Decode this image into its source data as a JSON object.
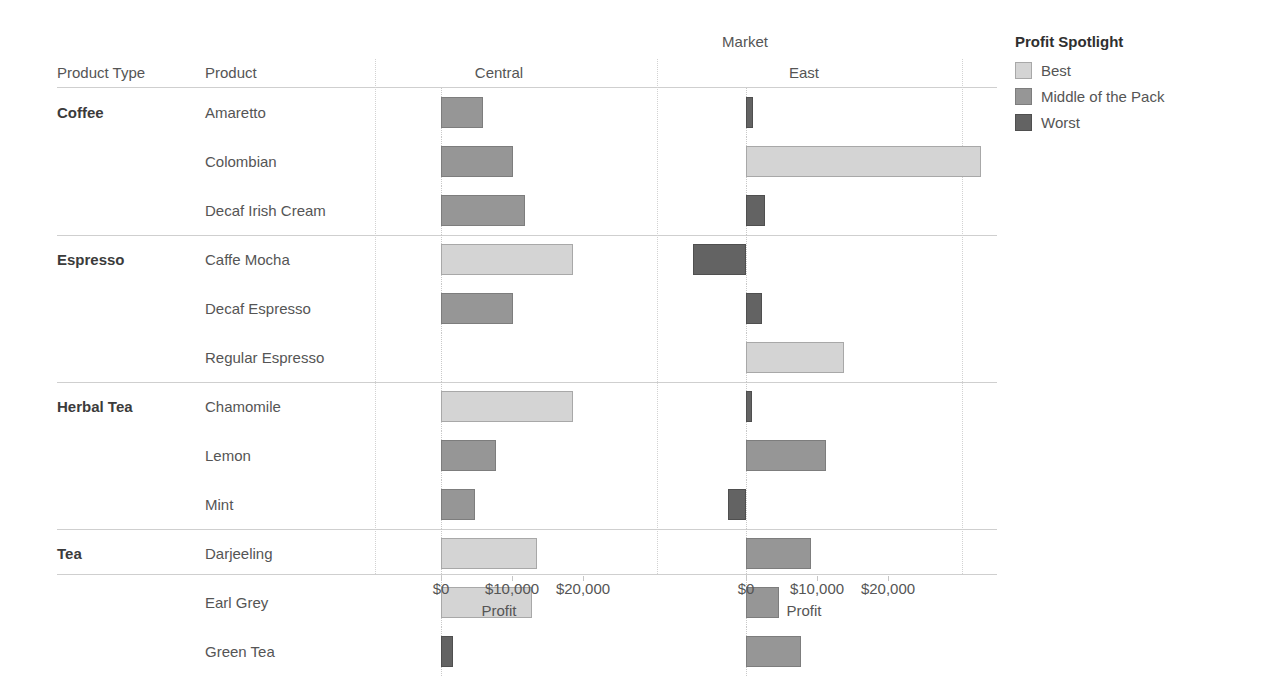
{
  "headers": {
    "product_type": "Product Type",
    "product": "Product",
    "market_band": "Market"
  },
  "legend": {
    "title": "Profit Spotlight",
    "items": [
      {
        "label": "Best",
        "key": "best",
        "color": "#d4d4d4"
      },
      {
        "label": "Middle of the Pack",
        "key": "mid",
        "color": "#969696"
      },
      {
        "label": "Worst",
        "key": "worst",
        "color": "#636363"
      }
    ]
  },
  "axis": {
    "title": "Profit",
    "ticks": [
      "$0",
      "$10,000",
      "$20,000"
    ],
    "tick_values": [
      0,
      10000,
      20000
    ]
  },
  "chart_data": {
    "type": "bar",
    "title": "Market",
    "xlabel": "Profit",
    "ylabel": "Product",
    "orientation": "horizontal",
    "grid": true,
    "legend_position": "right",
    "legend_title": "Profit Spotlight",
    "xlim": [
      -10000,
      35000
    ],
    "xticks": [
      0,
      10000,
      20000
    ],
    "xticklabels": [
      "$0",
      "$10,000",
      "$20,000"
    ],
    "panels": [
      "Central",
      "East"
    ],
    "groups": [
      {
        "product_type": "Coffee",
        "products": [
          {
            "name": "Amaretto",
            "Central": 5900,
            "Central_spotlight": "mid",
            "East": 1000,
            "East_spotlight": "worst"
          },
          {
            "name": "Colombian",
            "Central": 10100,
            "Central_spotlight": "mid",
            "East": 33100,
            "East_spotlight": "best"
          },
          {
            "name": "Decaf Irish Cream",
            "Central": 11800,
            "Central_spotlight": "mid",
            "East": 2700,
            "East_spotlight": "worst"
          }
        ]
      },
      {
        "product_type": "Espresso",
        "products": [
          {
            "name": "Caffe Mocha",
            "Central": 18600,
            "Central_spotlight": "best",
            "East": -7500,
            "East_spotlight": "worst"
          },
          {
            "name": "Decaf Espresso",
            "Central": 10100,
            "Central_spotlight": "mid",
            "East": 2300,
            "East_spotlight": "worst"
          },
          {
            "name": "Regular Espresso",
            "Central": 0,
            "Central_spotlight": "none",
            "East": 13800,
            "East_spotlight": "best"
          }
        ]
      },
      {
        "product_type": "Herbal Tea",
        "products": [
          {
            "name": "Chamomile",
            "Central": 18600,
            "Central_spotlight": "best",
            "East": 800,
            "East_spotlight": "worst"
          },
          {
            "name": "Lemon",
            "Central": 7800,
            "Central_spotlight": "mid",
            "East": 11300,
            "East_spotlight": "mid"
          },
          {
            "name": "Mint",
            "Central": 4800,
            "Central_spotlight": "mid",
            "East": -2500,
            "East_spotlight": "worst"
          }
        ]
      },
      {
        "product_type": "Tea",
        "products": [
          {
            "name": "Darjeeling",
            "Central": 13500,
            "Central_spotlight": "best",
            "East": 9200,
            "East_spotlight": "mid"
          },
          {
            "name": "Earl Grey",
            "Central": 12800,
            "Central_spotlight": "best",
            "East": 4700,
            "East_spotlight": "mid"
          },
          {
            "name": "Green Tea",
            "Central": 1700,
            "Central_spotlight": "worst",
            "East": 7800,
            "East_spotlight": "mid"
          }
        ]
      }
    ]
  }
}
